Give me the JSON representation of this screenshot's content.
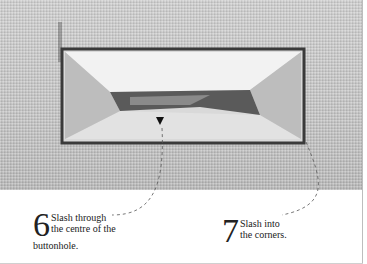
{
  "figure": {
    "colors": {
      "fabric": "#c9c9c9",
      "stitch": "#3a3a3a",
      "background": "#ffffff",
      "text": "#222222"
    }
  },
  "captions": [
    {
      "step": "6",
      "text_line1": "Slash through",
      "text_line2": "the centre of the",
      "text_line3": "buttonhole."
    },
    {
      "step": "7",
      "text_line1": "Slash into",
      "text_line2": "the corners."
    }
  ]
}
